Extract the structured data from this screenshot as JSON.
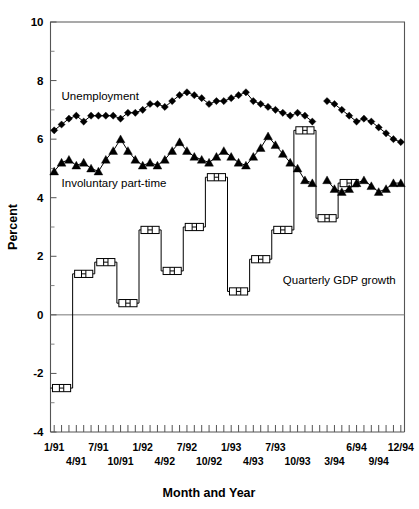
{
  "chart_data": {
    "type": "line",
    "title": "",
    "xlabel": "Month and Year",
    "ylabel": "Percent",
    "ylim": [
      -4,
      10
    ],
    "ytick_values": [
      -4,
      -2,
      0,
      2,
      4,
      6,
      8,
      10
    ],
    "ytick_labels": [
      "-4",
      "-2",
      "0",
      "2",
      "4",
      "6",
      "8",
      "10"
    ],
    "yminor_values": [
      -3,
      -1,
      1,
      3,
      5,
      7,
      9
    ],
    "grid": false,
    "legend_position": "inline-annotations",
    "x_axis_note": "Monthly ticks from 1/91 through 12/94 (48 months)",
    "xtick_labels_upper": [
      "1/91",
      "7/91",
      "1/92",
      "7/92",
      "1/93",
      "7/93",
      "6/94",
      "12/94"
    ],
    "xtick_labels_lower": [
      "4/91",
      "10/91",
      "4/92",
      "10/92",
      "4/93",
      "10/93",
      "3/94",
      "9/94"
    ],
    "xtick_months_upper": [
      "1/91",
      "7/91",
      "1/92",
      "7/92",
      "1/93",
      "7/93",
      "6/94",
      "12/94"
    ],
    "xtick_months_lower": [
      "4/91",
      "10/91",
      "4/92",
      "10/92",
      "4/93",
      "10/93",
      "3/94",
      "9/94"
    ],
    "series": [
      {
        "name": "Unemployment",
        "marker": "diamond",
        "label_text": "Unemployment",
        "x": [
          "1/91",
          "2/91",
          "3/91",
          "4/91",
          "5/91",
          "6/91",
          "7/91",
          "8/91",
          "9/91",
          "10/91",
          "11/91",
          "12/91",
          "1/92",
          "2/92",
          "3/92",
          "4/92",
          "5/92",
          "6/92",
          "7/92",
          "8/92",
          "9/92",
          "10/92",
          "11/92",
          "12/92",
          "1/93",
          "2/93",
          "3/93",
          "4/93",
          "5/93",
          "6/93",
          "7/93",
          "8/93",
          "9/93",
          "10/93",
          "11/93",
          "12/93",
          "2/94",
          "3/94",
          "4/94",
          "5/94",
          "6/94",
          "7/94",
          "8/94",
          "9/94",
          "10/94",
          "11/94",
          "12/94"
        ],
        "values": [
          6.3,
          6.5,
          6.7,
          6.8,
          6.6,
          6.8,
          6.8,
          6.8,
          6.8,
          6.7,
          6.9,
          6.9,
          7.0,
          7.2,
          7.2,
          7.1,
          7.3,
          7.5,
          7.6,
          7.5,
          7.4,
          7.2,
          7.3,
          7.3,
          7.4,
          7.5,
          7.6,
          7.3,
          7.2,
          7.1,
          7.0,
          6.9,
          6.8,
          6.9,
          6.8,
          6.6,
          7.3,
          7.2,
          7.0,
          6.8,
          6.6,
          6.7,
          6.6,
          6.4,
          6.2,
          6.0,
          5.9
        ],
        "note": "Series is drawn in two segments with a break between 12/93 and 2/94"
      },
      {
        "name": "Involuntary part-time",
        "marker": "triangle",
        "label_text": "Involuntary part-time",
        "x": [
          "1/91",
          "2/91",
          "3/91",
          "4/91",
          "5/91",
          "6/91",
          "7/91",
          "8/91",
          "9/91",
          "10/91",
          "11/91",
          "12/91",
          "1/92",
          "2/92",
          "3/92",
          "4/92",
          "5/92",
          "6/92",
          "7/92",
          "8/92",
          "9/92",
          "10/92",
          "11/92",
          "12/92",
          "1/93",
          "2/93",
          "3/93",
          "4/93",
          "5/93",
          "6/93",
          "7/93",
          "8/93",
          "9/93",
          "10/93",
          "11/93",
          "12/93",
          "2/94",
          "3/94",
          "4/94",
          "5/94",
          "6/94",
          "7/94",
          "8/94",
          "9/94",
          "10/94",
          "11/94",
          "12/94"
        ],
        "values": [
          4.9,
          5.2,
          5.3,
          5.1,
          5.2,
          5.0,
          4.9,
          5.3,
          5.6,
          6.0,
          5.6,
          5.3,
          5.1,
          5.2,
          5.1,
          5.3,
          5.6,
          5.9,
          5.6,
          5.4,
          5.3,
          5.2,
          5.4,
          5.6,
          5.4,
          5.2,
          5.1,
          5.4,
          5.7,
          6.1,
          5.8,
          5.5,
          5.2,
          5.0,
          4.6,
          4.5,
          4.6,
          4.3,
          4.2,
          4.3,
          4.5,
          4.6,
          4.4,
          4.2,
          4.3,
          4.5,
          4.5
        ],
        "note": "Series is drawn in two segments with a break between 12/93 and 2/94"
      },
      {
        "name": "Quarterly GDP growth",
        "marker": "rectangle",
        "label_text": "Quarterly GDP growth",
        "x": [
          "1Q91",
          "2Q91",
          "3Q91",
          "4Q91",
          "1Q92",
          "2Q92",
          "3Q92",
          "4Q92",
          "1Q93",
          "2Q93",
          "3Q93",
          "4Q93",
          "1Q94",
          "2Q94"
        ],
        "x_center_months": [
          "2/91",
          "5/91",
          "8/91",
          "11/91",
          "2/92",
          "5/92",
          "8/92",
          "11/92",
          "2/93",
          "5/93",
          "8/93",
          "11/93",
          "2/94",
          "5/94"
        ],
        "values": [
          -2.5,
          1.4,
          1.8,
          0.4,
          2.9,
          1.5,
          3.0,
          4.7,
          0.8,
          1.9,
          2.9,
          6.3,
          3.3,
          4.5
        ],
        "note": "Plotted as quarterly flat bars spanning three months each, with a break after 4Q93"
      }
    ],
    "annotations": [
      {
        "text": "Unemployment",
        "anchor_month": "2/91",
        "anchor_value": 7.35
      },
      {
        "text": "Involuntary part-time",
        "anchor_month": "2/91",
        "anchor_value": 4.35
      },
      {
        "text": "Quarterly GDP growth",
        "anchor_month": "8/93",
        "anchor_value": 1.05
      }
    ]
  },
  "axes": {
    "ylabel": "Percent",
    "xlabel": "Month and Year"
  }
}
